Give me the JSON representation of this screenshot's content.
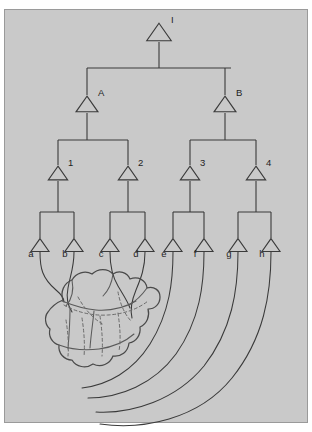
{
  "figure": {
    "background_color": "#ffffff",
    "plate_color": "#c9c9c9",
    "line_color": "#3a3a3a",
    "plate": {
      "x": 4,
      "y": 9,
      "width": 304,
      "height": 414
    }
  },
  "nodes": {
    "root": {
      "label": "I",
      "cx": 159,
      "cy": 32,
      "size": 19,
      "label_dx": 12,
      "label_dy": -9
    },
    "level2": [
      {
        "label": "A",
        "cx": 87,
        "cy": 104,
        "size": 17,
        "label_dx": 11,
        "label_dy": -8
      },
      {
        "label": "B",
        "cx": 225,
        "cy": 104,
        "size": 17,
        "label_dx": 11,
        "label_dy": -8
      }
    ],
    "level3": [
      {
        "label": "1",
        "cx": 58,
        "cy": 173,
        "size": 15,
        "label_dx": 10,
        "label_dy": -7
      },
      {
        "label": "2",
        "cx": 128,
        "cy": 173,
        "size": 15,
        "label_dx": 10,
        "label_dy": -7
      },
      {
        "label": "3",
        "cx": 190,
        "cy": 173,
        "size": 15,
        "label_dx": 10,
        "label_dy": -7
      },
      {
        "label": "4",
        "cx": 256,
        "cy": 173,
        "size": 15,
        "label_dx": 10,
        "label_dy": -7
      }
    ],
    "leaves": [
      {
        "label": "a",
        "cx": 40,
        "cy": 245,
        "size": 14,
        "label_dx": -9,
        "label_dy": 12
      },
      {
        "label": "b",
        "cx": 74,
        "cy": 245,
        "size": 14,
        "label_dx": -9,
        "label_dy": 12
      },
      {
        "label": "c",
        "cx": 110,
        "cy": 245,
        "size": 14,
        "label_dx": -9,
        "label_dy": 12
      },
      {
        "label": "d",
        "cx": 145,
        "cy": 245,
        "size": 14,
        "label_dx": -9,
        "label_dy": 12
      },
      {
        "label": "e",
        "cx": 173,
        "cy": 245,
        "size": 14,
        "label_dx": -9,
        "label_dy": 12
      },
      {
        "label": "f",
        "cx": 204,
        "cy": 245,
        "size": 14,
        "label_dx": -9,
        "label_dy": 12
      },
      {
        "label": "g",
        "cx": 238,
        "cy": 245,
        "size": 14,
        "label_dx": -9,
        "label_dy": 12
      },
      {
        "label": "h",
        "cx": 271,
        "cy": 245,
        "size": 14,
        "label_dx": -9,
        "label_dy": 12
      }
    ]
  },
  "tree_edges": {
    "root_stem": "M159,42 L159,68",
    "root_bus": "M87,68 L231,68",
    "bus_drops": [
      "M87,68 L87,95",
      "M225,68 L225,95"
    ],
    "a_stem": "M87,113 L87,140",
    "a_bus": "M58,140 L128,140",
    "a_drops": [
      "M58,140 L58,165",
      "M128,140 L128,165"
    ],
    "b_stem": "M225,113 L225,140",
    "b_bus": "M190,140 L256,140",
    "b_drops": [
      "M190,140 L190,165",
      "M256,140 L256,165"
    ],
    "n1_stem": "M58,181 L58,212",
    "n1_bus": "M40,212 L74,212",
    "n1_drops": [
      "M40,212 L40,238",
      "M74,212 L74,238"
    ],
    "n2_stem": "M128,181 L128,212",
    "n2_bus": "M110,212 L145,212",
    "n2_drops": [
      "M110,212 L110,238",
      "M145,212 L145,238"
    ],
    "n3_stem": "M190,181 L190,212",
    "n3_bus": "M173,212 L204,212",
    "n3_drops": [
      "M173,212 L173,238",
      "M204,212 L204,238"
    ],
    "n4_stem": "M256,181 L256,212",
    "n4_bus": "M238,212 L238,212",
    "n4_bus_full": "M238,212 L271,212",
    "n4_drops": [
      "M238,212 L238,238",
      "M271,212 L271,238"
    ]
  },
  "projections": [
    {
      "from": "a",
      "path": "M40,252 C40,268 42,278 56,290 C62,295 64,298 64,302"
    },
    {
      "from": "b",
      "path": "M74,252 C74,268 70,276 68,288 C66,298 68,306 72,312"
    },
    {
      "from": "c",
      "path": "M110,252 C110,266 112,276 118,286 C124,296 128,302 130,308"
    },
    {
      "from": "d",
      "path": "M145,252 C145,268 141,278 136,290 C131,302 130,310 132,318"
    },
    {
      "from": "e",
      "path": "M173,252 C173,280 170,312 150,344 C133,371 108,385 82,388"
    },
    {
      "from": "f",
      "path": "M204,252 C204,284 200,320 176,354 C154,384 120,398 88,398"
    },
    {
      "from": "g",
      "path": "M238,252 C238,290 232,330 204,366 C176,400 132,414 96,412"
    },
    {
      "from": "h",
      "path": "M271,252 C271,294 264,338 232,378 C198,420 142,430 100,424"
    }
  ],
  "brain": {
    "name": "brain-blob",
    "outline": "M63,300 C60,292 64,283 72,280 C76,273 85,270 92,274 C98,268 108,268 113,274 C119,270 127,272 130,279 C138,276 146,280 147,288 C154,286 160,290 160,297 C160,304 155,309 148,309 C150,316 147,324 140,327 C141,335 136,342 129,343 C128,352 121,357 113,356 C110,364 101,368 93,364 C86,369 76,367 72,360 C64,360 58,353 59,345 C52,343 48,336 50,329 C45,325 44,317 48,312 C52,306 58,302 63,300 Z",
    "folds": [
      "M62,301 C72,305 82,309 96,310 C110,311 124,308 136,301",
      "M72,280 C74,290 72,299 66,306",
      "M113,274 C112,282 109,290 103,296",
      "M147,288 C142,295 136,301 129,305",
      "M59,345 C70,349 84,351 99,349 C113,347 125,342 134,334",
      "M94,311 C93,322 91,334 90,348",
      "M70,309 C70,322 69,336 68,349"
    ],
    "hidden_folds": [
      "M64,305 C76,312 92,316 108,315 C124,314 138,309 148,301",
      "M78,297 C84,308 92,318 104,325",
      "M118,292 C120,303 124,314 132,322",
      "M66,320 C68,333 69,345 68,356",
      "M82,318 C84,331 85,344 84,357",
      "M100,316 C102,330 103,343 102,356",
      "M118,313 C120,327 121,339 119,351"
    ]
  }
}
